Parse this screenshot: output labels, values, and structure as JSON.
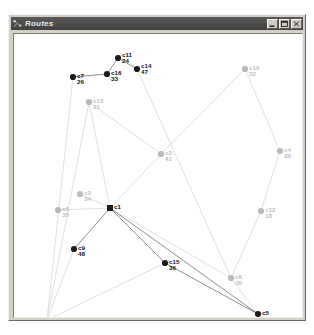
{
  "window": {
    "title": "Routes",
    "icon": "route-network-icon",
    "controls": [
      {
        "name": "minimize-button",
        "glyph": "minimize"
      },
      {
        "name": "maximize-button",
        "glyph": "maximize"
      },
      {
        "name": "close-button",
        "glyph": "close"
      }
    ]
  },
  "colors": {
    "background": "#ffffff",
    "frame": "#d4d0c8",
    "titlebar": "#3f3f3f",
    "titlebar_text": "#e8e8e8",
    "node_active": "#1c1c1c",
    "node_inactive": "#b9b9b9",
    "edge_active": "#6b6b6b",
    "edge_inactive": "#d2d2d2",
    "label_active": "#111111",
    "label_inactive": "#bdbdbd"
  },
  "chart_data": {
    "type": "scatter",
    "title": "Routes",
    "xlabel": "",
    "ylabel": "",
    "xlim": [
      0,
      290
    ],
    "ylim": [
      0,
      285
    ],
    "grid": false,
    "legend": null,
    "depot": {
      "id": "c1",
      "demand": "",
      "x": 101,
      "y": 194,
      "shape": "square",
      "state": "active"
    },
    "nodes": [
      {
        "id": "c11",
        "demand": "24",
        "x": 109,
        "y": 44,
        "state": "active",
        "label_dx": 4,
        "label_dy": -1
      },
      {
        "id": "c14",
        "demand": "47",
        "x": 128,
        "y": 55,
        "state": "active",
        "label_dx": 4,
        "label_dy": -1
      },
      {
        "id": "c16",
        "demand": "33",
        "x": 98,
        "y": 60,
        "state": "active",
        "label_dx": 4,
        "label_dy": 1
      },
      {
        "id": "c7",
        "demand": "26",
        "x": 64,
        "y": 63,
        "state": "active",
        "label_dx": 4,
        "label_dy": 1
      },
      {
        "id": "c10",
        "demand": "32",
        "x": 236,
        "y": 55,
        "state": "inactive",
        "label_dx": 4,
        "label_dy": 1
      },
      {
        "id": "c13",
        "demand": "21",
        "x": 80,
        "y": 88,
        "state": "inactive",
        "label_dx": 4,
        "label_dy": 1
      },
      {
        "id": "c4",
        "demand": "39",
        "x": 271,
        "y": 137,
        "state": "inactive",
        "label_dx": 4,
        "label_dy": 1
      },
      {
        "id": "c2",
        "demand": "41",
        "x": 152,
        "y": 140,
        "state": "inactive",
        "label_dx": 4,
        "label_dy": 1
      },
      {
        "id": "c3",
        "demand": "34",
        "x": 71,
        "y": 180,
        "state": "inactive",
        "label_dx": 4,
        "label_dy": 1
      },
      {
        "id": "c6",
        "demand": "35",
        "x": 49,
        "y": 196,
        "state": "inactive",
        "label_dx": 4,
        "label_dy": 1
      },
      {
        "id": "c12",
        "demand": "18",
        "x": 252,
        "y": 197,
        "state": "inactive",
        "label_dx": 4,
        "label_dy": 1
      },
      {
        "id": "c9",
        "demand": "48",
        "x": 65,
        "y": 235,
        "state": "active",
        "label_dx": 4,
        "label_dy": 1
      },
      {
        "id": "c15",
        "demand": "36",
        "x": 156,
        "y": 249,
        "state": "active",
        "label_dx": 4,
        "label_dy": 1
      },
      {
        "id": "c8",
        "demand": "30",
        "x": 222,
        "y": 264,
        "state": "inactive",
        "label_dx": 4,
        "label_dy": 1
      },
      {
        "id": "c5",
        "demand": "23",
        "x": 249,
        "y": 300,
        "state": "active",
        "label_dx": 4,
        "label_dy": 1
      },
      {
        "id": "c17",
        "demand": "40",
        "x": 38,
        "y": 306,
        "state": "inactive",
        "label_dx": 4,
        "label_dy": 1
      }
    ],
    "edges": [
      {
        "from": "c7",
        "to": "c16",
        "state": "active"
      },
      {
        "from": "c16",
        "to": "c11",
        "state": "active"
      },
      {
        "from": "c11",
        "to": "c14",
        "state": "active"
      },
      {
        "from": "c7",
        "to": "c17",
        "state": "inactive"
      },
      {
        "from": "c14",
        "to": "c8",
        "state": "inactive"
      },
      {
        "from": "c10",
        "to": "c2",
        "state": "inactive"
      },
      {
        "from": "c10",
        "to": "c4",
        "state": "inactive"
      },
      {
        "from": "c4",
        "to": "c12",
        "state": "inactive"
      },
      {
        "from": "c12",
        "to": "c8",
        "state": "inactive"
      },
      {
        "from": "c13",
        "to": "c2",
        "state": "inactive"
      },
      {
        "from": "c13",
        "to": "c17",
        "state": "inactive"
      },
      {
        "from": "c13",
        "to": "c1",
        "state": "inactive"
      },
      {
        "from": "c2",
        "to": "c1",
        "state": "inactive"
      },
      {
        "from": "c3",
        "to": "c1",
        "state": "inactive"
      },
      {
        "from": "c6",
        "to": "c1",
        "state": "inactive"
      },
      {
        "from": "c1",
        "to": "c9",
        "state": "active"
      },
      {
        "from": "c9",
        "to": "c17",
        "state": "inactive"
      },
      {
        "from": "c1",
        "to": "c15",
        "state": "active"
      },
      {
        "from": "c15",
        "to": "c17",
        "state": "inactive"
      },
      {
        "from": "c15",
        "to": "c5",
        "state": "active"
      },
      {
        "from": "c1",
        "to": "c8",
        "state": "inactive"
      },
      {
        "from": "c1",
        "to": "c5",
        "state": "active"
      },
      {
        "from": "c8",
        "to": "c5",
        "state": "inactive"
      }
    ]
  }
}
